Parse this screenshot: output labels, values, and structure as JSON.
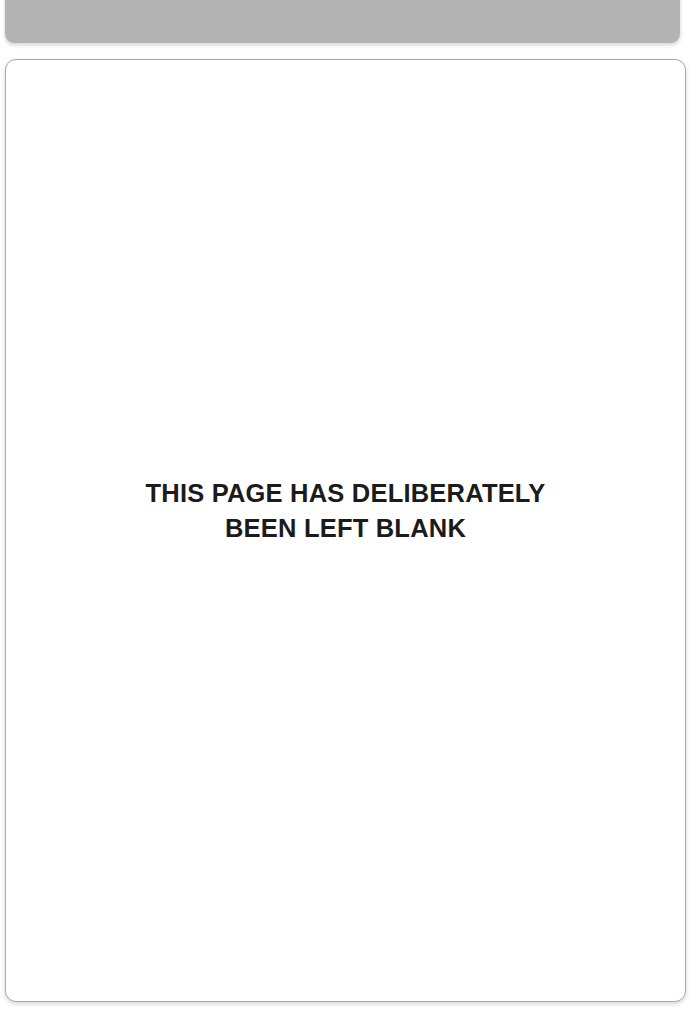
{
  "viewer": {
    "background_color": "#ffffff"
  },
  "page_previous": {
    "label": "previous page partial",
    "fill_color": "#b3b3b3"
  },
  "page_current": {
    "label": "blank page",
    "fill_color": "#ffffff",
    "border_color": "#a9a9a9",
    "notice": {
      "text_color": "#1b1b1b",
      "line_1": "THIS PAGE HAS DELIBERATELY",
      "line_2": "BEEN LEFT BLANK"
    }
  }
}
